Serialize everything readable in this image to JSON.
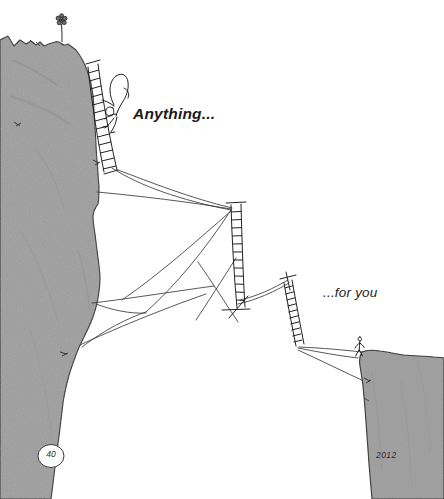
{
  "page": {
    "width": 444,
    "height": 499,
    "background_color": "#ffffff",
    "page_number": "40",
    "year": "2012"
  },
  "colors": {
    "cliff_fill": "#9e9e9e",
    "cliff_fill_light": "#a8a8a8",
    "cliff_outline": "#2e2e2e",
    "ink": "#1f1f1f",
    "rope": "#3a3a3a",
    "text": "#1b1b1b"
  },
  "captions": {
    "anything": "Anything...",
    "for_you": "...for you"
  },
  "scene": {
    "title": "Anything... for you",
    "description": "Two cliffs separated by a chasm, bridged by ladders and ropes. A climber ascends a ladder on the tall left cliff toward a flower at the summit; a small figure waits on the lower right cliff.",
    "elements": [
      {
        "name": "left-cliff",
        "kind": "cliff",
        "side": "left"
      },
      {
        "name": "right-cliff",
        "kind": "cliff",
        "side": "right"
      },
      {
        "name": "summit-flower",
        "kind": "flower"
      },
      {
        "name": "climber-figure",
        "kind": "person"
      },
      {
        "name": "waiting-figure",
        "kind": "person"
      },
      {
        "name": "upper-ladder",
        "kind": "ladder"
      },
      {
        "name": "middle-ladder",
        "kind": "ladder"
      },
      {
        "name": "right-ladder",
        "kind": "ladder"
      },
      {
        "name": "rope-network",
        "kind": "ropes"
      }
    ]
  }
}
